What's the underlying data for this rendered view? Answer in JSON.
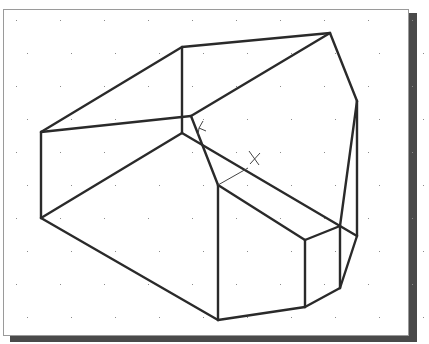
{
  "viewport": {
    "name": "3D wireframe model view",
    "background": "#ffffff",
    "line_color": "#2a2a2a",
    "grid_color": "#8a8a8a",
    "shadow_color": "#4a4a4a"
  },
  "ucs_icon": {
    "x_label": "X",
    "y_label": "Y"
  },
  "model": {
    "vertices": {
      "A": [
        41,
        132
      ],
      "B": [
        41,
        218
      ],
      "C": [
        182,
        47
      ],
      "D": [
        182,
        133
      ],
      "E": [
        330,
        33
      ],
      "F": [
        191,
        116
      ],
      "G": [
        357,
        101
      ],
      "H": [
        218,
        185
      ],
      "I": [
        218,
        320
      ],
      "J": [
        305,
        240
      ],
      "K": [
        305,
        307
      ],
      "L": [
        340,
        226
      ],
      "M": [
        340,
        288
      ],
      "N": [
        357,
        236
      ]
    }
  }
}
